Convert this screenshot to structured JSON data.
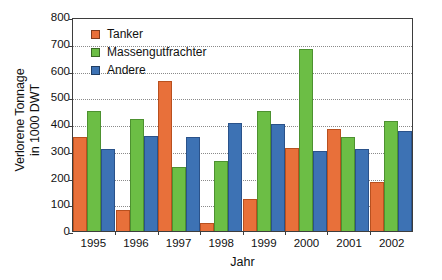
{
  "chart_data": {
    "type": "bar",
    "title": "",
    "subtitle": "",
    "xlabel": "Jahr",
    "ylabel": "Verlorene Tonnage in 1000 DWT",
    "ylabel_line1": "Verlorene Tonnage",
    "ylabel_line2": "in 1000 DWT",
    "categories": [
      "1995",
      "1996",
      "1997",
      "1998",
      "1999",
      "2000",
      "2001",
      "2002"
    ],
    "series": [
      {
        "name": "Tanker",
        "color": "#e8703a",
        "values": [
          350,
          80,
          560,
          30,
          120,
          310,
          380,
          185
        ]
      },
      {
        "name": "Massengutfrachter",
        "color": "#6cbe45",
        "values": [
          450,
          420,
          240,
          260,
          450,
          680,
          350,
          410
        ]
      },
      {
        "name": "Andere",
        "color": "#3d72b4",
        "values": [
          305,
          355,
          350,
          405,
          400,
          300,
          305,
          375
        ]
      }
    ],
    "ylim": [
      0,
      800
    ],
    "ytick_values": [
      0,
      100,
      200,
      300,
      400,
      500,
      600,
      700,
      800
    ],
    "ytick_labels": [
      "0",
      "100",
      "200",
      "300",
      "400",
      "500",
      "600",
      "700",
      "800"
    ],
    "grid": true,
    "grid_axis": "y",
    "grid_style": "dotted",
    "legend_position": "top-left-inside",
    "bar_grouping": "grouped",
    "annotations": []
  },
  "legend": {
    "entries": [
      {
        "label": "Tanker",
        "swatch": "tanker-swatch"
      },
      {
        "label": "Massengutfrachter",
        "swatch": "massengutfrachter-swatch"
      },
      {
        "label": "Andere",
        "swatch": "andere-swatch"
      }
    ]
  }
}
